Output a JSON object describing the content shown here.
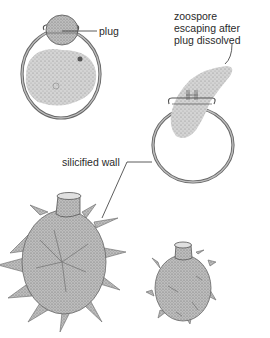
{
  "diagram": {
    "colors": {
      "outline": "#555555",
      "wall": "#9a9a9a",
      "stipple": "#b0b0b0",
      "background": "#ffffff",
      "text": "#2a2a2a"
    },
    "labels": {
      "plug": "plug",
      "zoospore_line1": "zoospore",
      "zoospore_line2": "escaping after",
      "zoospore_line3": "plug dissolved",
      "silicified_wall": "silicified wall"
    },
    "figures": [
      {
        "id": "cyst-with-plug",
        "description": "cyst with plug in pore, cytoplasm inside"
      },
      {
        "id": "zoospore-escaping",
        "description": "empty cyst with zoospore emerging through pore"
      },
      {
        "id": "spiny-cyst-large",
        "description": "large cyst with spiny silicified wall"
      },
      {
        "id": "spiny-cyst-small",
        "description": "small cyst with short-spined silicified wall"
      }
    ]
  }
}
